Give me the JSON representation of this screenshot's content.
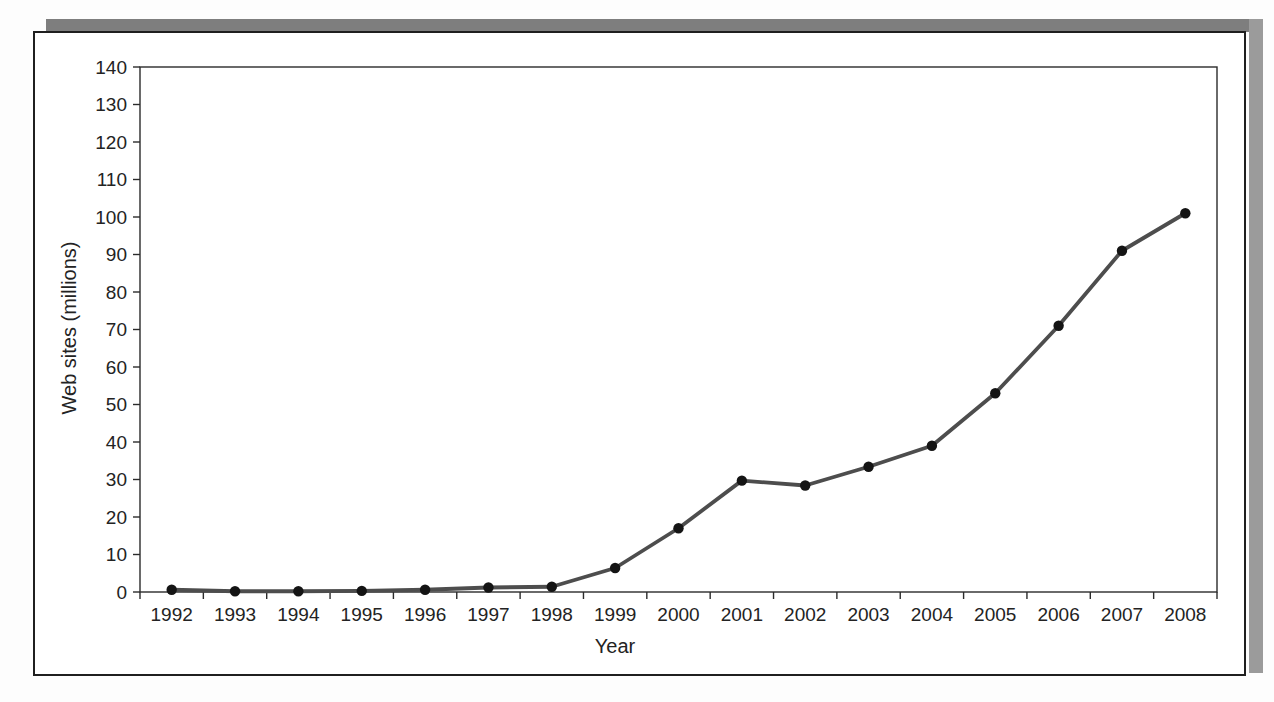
{
  "figure": {
    "background": "#ffffff",
    "page_background": "#fdfdfd",
    "frame_color": "#1f1f1f",
    "shadow_top_color": "#7e7e7e",
    "shadow_right_color": "#9b9b9b"
  },
  "chart_data": {
    "type": "line",
    "title": "",
    "xlabel": "Year",
    "ylabel": "Web sites (millions)",
    "categories": [
      "1992",
      "1993",
      "1994",
      "1995",
      "1996",
      "1997",
      "1998",
      "1999",
      "2000",
      "2001",
      "2002",
      "2003",
      "2004",
      "2005",
      "2006",
      "2007",
      "2008"
    ],
    "series": [
      {
        "name": "Web sites",
        "values": [
          0.6,
          0.2,
          0.2,
          0.3,
          0.6,
          1.2,
          1.4,
          6.4,
          17,
          29.7,
          28.4,
          33.4,
          39,
          53,
          71,
          91,
          101
        ]
      }
    ],
    "ylim": [
      0,
      140
    ],
    "ytick_step": 10,
    "yticks": [
      0,
      10,
      20,
      30,
      40,
      50,
      60,
      70,
      80,
      90,
      100,
      110,
      120,
      130,
      140
    ],
    "grid": false,
    "legend": false,
    "line_color": "#4d4d4d",
    "marker_color": "#141414",
    "axis_color": "#2b2b2b",
    "tick_label_color": "#232323"
  }
}
